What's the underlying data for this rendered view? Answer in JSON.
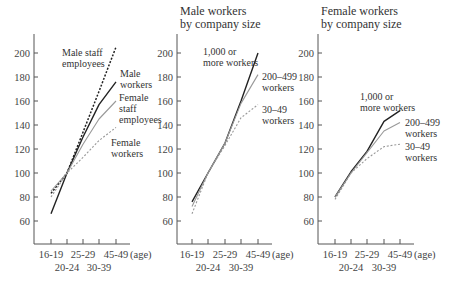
{
  "chart_data": [
    {
      "type": "line",
      "title": "",
      "xlabel": "(age)",
      "ylabel": "",
      "categories": [
        "16-19",
        "20-24",
        "25-29",
        "30-39",
        "45-49"
      ],
      "yticks": [
        60,
        80,
        100,
        120,
        140,
        160,
        180,
        200
      ],
      "ylim": [
        45,
        215
      ],
      "grid": false,
      "series": [
        {
          "name": "Male staff employees",
          "style": "dotted-black",
          "values": [
            83,
            100,
            134,
            168,
            205
          ]
        },
        {
          "name": "Male workers",
          "style": "solid-black",
          "values": [
            66,
            100,
            130,
            157,
            176
          ]
        },
        {
          "name": "Female staff employees",
          "style": "solid-gray",
          "values": [
            85,
            100,
            124,
            145,
            160
          ]
        },
        {
          "name": "Female workers",
          "style": "dotted-gray",
          "values": [
            80,
            100,
            113,
            127,
            138
          ]
        }
      ]
    },
    {
      "type": "line",
      "title": "Male workers by company size",
      "xlabel": "(age)",
      "ylabel": "",
      "categories": [
        "16-19",
        "20-24",
        "25-29",
        "30-39",
        "45-49"
      ],
      "yticks": [
        60,
        80,
        100,
        120,
        140,
        160,
        180,
        200
      ],
      "ylim": [
        45,
        215
      ],
      "grid": false,
      "series": [
        {
          "name": "1,000 or more workers",
          "style": "solid-black",
          "values": [
            76,
            100,
            125,
            160,
            200
          ]
        },
        {
          "name": "200–499 workers",
          "style": "solid-gray",
          "values": [
            72,
            100,
            125,
            158,
            182
          ]
        },
        {
          "name": "30–49 workers",
          "style": "dotted-gray",
          "values": [
            66,
            100,
            123,
            146,
            157
          ]
        }
      ]
    },
    {
      "type": "line",
      "title": "Female workers by company size",
      "xlabel": "(age)",
      "ylabel": "",
      "categories": [
        "16-19",
        "20-24",
        "25-29",
        "30-39",
        "45-49"
      ],
      "yticks": [
        60,
        80,
        100,
        120,
        140,
        160,
        180,
        200
      ],
      "ylim": [
        45,
        215
      ],
      "grid": false,
      "series": [
        {
          "name": "1,000 or more workers",
          "style": "solid-black",
          "values": [
            80,
            101,
            118,
            143,
            152
          ]
        },
        {
          "name": "200–499 workers",
          "style": "solid-gray",
          "values": [
            80,
            100,
            117,
            135,
            142
          ]
        },
        {
          "name": "30–49 workers",
          "style": "dotted-gray",
          "values": [
            78,
            100,
            112,
            122,
            124
          ]
        }
      ]
    }
  ],
  "panels": [
    {
      "title_lines": [],
      "annotations": [
        {
          "lines": [
            "Male staff",
            "employees"
          ],
          "x": 62,
          "y": 56
        },
        {
          "lines": [
            "Male",
            "workers"
          ],
          "x": 120,
          "y": 77
        },
        {
          "lines": [
            "Female",
            "staff",
            "employees"
          ],
          "x": 119,
          "y": 101
        },
        {
          "lines": [
            "Female",
            "workers"
          ],
          "x": 111,
          "y": 146
        }
      ]
    },
    {
      "title_lines": [
        "Male workers",
        "by company size"
      ],
      "annotations": [
        {
          "lines": [
            "1,000 or",
            "more workers"
          ],
          "x": 203,
          "y": 55
        },
        {
          "lines": [
            "200–499",
            "workers"
          ],
          "x": 262,
          "y": 80
        },
        {
          "lines": [
            "30–49",
            "workers"
          ],
          "x": 262,
          "y": 113
        }
      ]
    },
    {
      "title_lines": [
        "Female workers",
        "by company size"
      ],
      "annotations": [
        {
          "lines": [
            "1,000 or",
            "more workers"
          ],
          "x": 360,
          "y": 100
        },
        {
          "lines": [
            "200–499",
            "workers"
          ],
          "x": 405,
          "y": 126
        },
        {
          "lines": [
            "30–49",
            "workers"
          ],
          "x": 405,
          "y": 150
        }
      ]
    }
  ],
  "x_tick_labels_row1": [
    "16-19",
    "25-29",
    "45-49"
  ],
  "x_tick_labels_row2": [
    "20-24",
    "30-39"
  ],
  "age_label": "(age)"
}
